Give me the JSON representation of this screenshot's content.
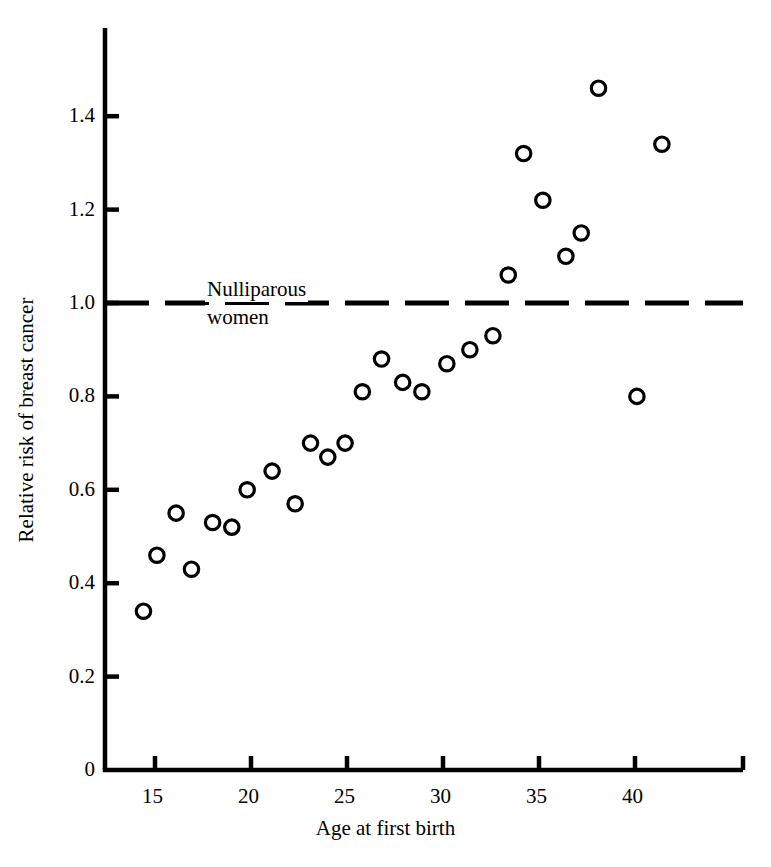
{
  "chart_data": {
    "type": "scatter",
    "title": "",
    "xlabel": "Age at first birth",
    "ylabel": "Relative risk of breast cancer",
    "xlim": [
      13.0,
      43.6
    ],
    "ylim": [
      0,
      1.57
    ],
    "grid": false,
    "legend": null,
    "xticks": [
      15,
      20,
      25,
      30,
      35,
      40
    ],
    "xtick_labels": [
      "15",
      "20",
      "25",
      "30",
      "35",
      "40"
    ],
    "yticks": [
      0,
      0.2,
      0.4,
      0.6,
      0.8,
      1.0,
      1.2,
      1.4
    ],
    "ytick_labels": [
      "0",
      "0.2",
      "0.4",
      "0.6",
      "0.8",
      "1.0",
      "1.2",
      "1.4"
    ],
    "marker": "open-circle",
    "marker_color": "#000000",
    "annotations": [
      {
        "name": "nulliparous-reference-line",
        "type": "hline",
        "y": 1.0,
        "style": "dashed",
        "label_line1": "Nulliparous",
        "label_line2": "women"
      }
    ],
    "points": [
      {
        "x": 14.4,
        "y": 0.34
      },
      {
        "x": 15.1,
        "y": 0.46
      },
      {
        "x": 16.1,
        "y": 0.55
      },
      {
        "x": 16.9,
        "y": 0.43
      },
      {
        "x": 18.0,
        "y": 0.53
      },
      {
        "x": 19.0,
        "y": 0.52
      },
      {
        "x": 19.8,
        "y": 0.6
      },
      {
        "x": 21.1,
        "y": 0.64
      },
      {
        "x": 22.3,
        "y": 0.57
      },
      {
        "x": 23.1,
        "y": 0.7
      },
      {
        "x": 24.0,
        "y": 0.67
      },
      {
        "x": 24.9,
        "y": 0.7
      },
      {
        "x": 25.8,
        "y": 0.81
      },
      {
        "x": 26.8,
        "y": 0.88
      },
      {
        "x": 27.9,
        "y": 0.83
      },
      {
        "x": 28.9,
        "y": 0.81
      },
      {
        "x": 30.2,
        "y": 0.87
      },
      {
        "x": 31.4,
        "y": 0.9
      },
      {
        "x": 32.6,
        "y": 0.93
      },
      {
        "x": 33.4,
        "y": 1.06
      },
      {
        "x": 34.2,
        "y": 1.32
      },
      {
        "x": 35.2,
        "y": 1.22
      },
      {
        "x": 36.4,
        "y": 1.1
      },
      {
        "x": 37.2,
        "y": 1.15
      },
      {
        "x": 38.1,
        "y": 1.46
      },
      {
        "x": 40.1,
        "y": 0.8
      },
      {
        "x": 41.4,
        "y": 1.34
      }
    ]
  },
  "axes": {
    "x_title": "Age at first birth",
    "y_title": "Relative risk of breast cancer"
  },
  "annotation": {
    "nulliparous_line1": "Nulliparous",
    "nulliparous_line2": "women"
  },
  "colors": {
    "ink": "#000000",
    "background": "#ffffff"
  }
}
